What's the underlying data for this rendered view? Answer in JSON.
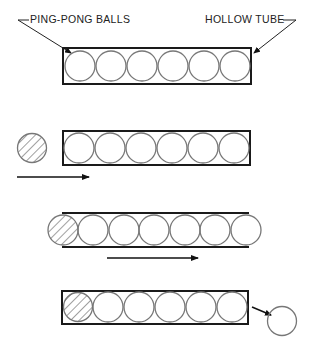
{
  "diagram": {
    "top_clipped_text": "g",
    "labels": {
      "balls": "PING-PONG BALLS",
      "tube": "HOLLOW TUBE"
    },
    "colors": {
      "tube_stroke": "#1a1a1a",
      "ball_stroke": "#777777",
      "hatch": "#777777",
      "arrow": "#111111"
    },
    "panels": [
      {
        "step": 1,
        "description": "Tube filled with six ping-pong balls"
      },
      {
        "step": 2,
        "description": "Hatched ball approaches tube from left; arrow points right"
      },
      {
        "step": 3,
        "description": "Hatched ball enters left end, pushing row so rightmost ball protrudes; arrow points right"
      },
      {
        "step": 4,
        "description": "Hatched ball inside tube; one ball ejected from right end"
      }
    ]
  }
}
